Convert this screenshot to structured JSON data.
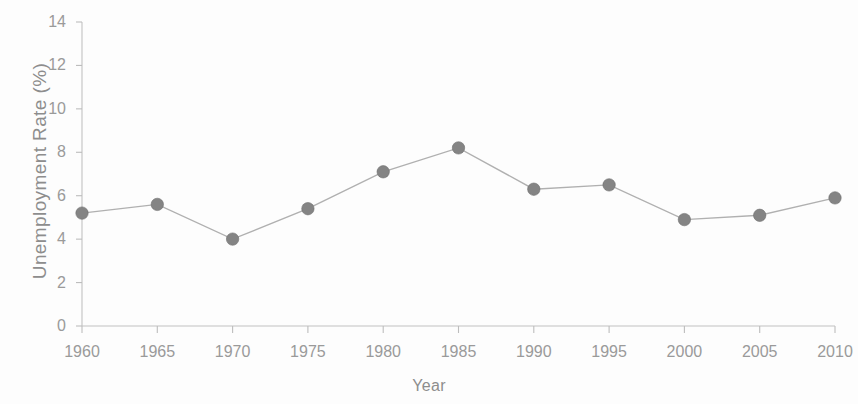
{
  "chart_data": {
    "type": "line",
    "title": "",
    "xlabel": "Year",
    "ylabel": "Unemployment Rate (%)",
    "x": [
      1960,
      1965,
      1970,
      1975,
      1980,
      1985,
      1990,
      1995,
      2000,
      2005,
      2010
    ],
    "values": [
      5.2,
      5.6,
      4.0,
      5.4,
      7.1,
      8.2,
      6.3,
      6.5,
      4.9,
      5.1,
      5.9
    ],
    "xtick_labels": [
      "1960",
      "1965",
      "1970",
      "1975",
      "1980",
      "1985",
      "1990",
      "1995",
      "2000",
      "2005",
      "2010"
    ],
    "ytick_labels": [
      "0",
      "2",
      "4",
      "6",
      "8",
      "10",
      "12",
      "14"
    ],
    "yticks": [
      0,
      2,
      4,
      6,
      8,
      10,
      12,
      14
    ],
    "xlim": [
      1960,
      2010
    ],
    "ylim": [
      0,
      14
    ],
    "grid": false,
    "legend": false,
    "marker": "circle",
    "line_color": "#b0b0b0",
    "marker_color": "#848484",
    "axis_color": "#c2c2c2",
    "text_color": "#9a9a9a"
  }
}
